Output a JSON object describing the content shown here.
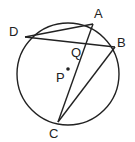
{
  "diagram": {
    "circle": {
      "cx": 68,
      "cy": 74,
      "r": 51
    },
    "center_label": "P",
    "intersection_label": "Q",
    "points": {
      "A": {
        "label": "A",
        "x": 93,
        "y": 24
      },
      "B": {
        "label": "B",
        "x": 115,
        "y": 47
      },
      "C": {
        "label": "C",
        "x": 58,
        "y": 122
      },
      "D": {
        "label": "D",
        "x": 25,
        "y": 37
      }
    },
    "segments": [
      "DA",
      "DB",
      "AC",
      "BC"
    ],
    "colors": {
      "stroke": "#222222",
      "background": "#ffffff"
    }
  }
}
